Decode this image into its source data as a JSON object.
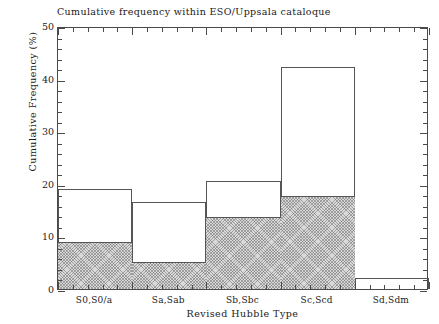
{
  "chart_data": {
    "type": "bar",
    "title": "Cumulative frequency within ESO/Uppsala cataloque",
    "xlabel": "Revised Hubble Type",
    "ylabel": "Cumulative Frequency (%)",
    "categories": [
      "S0,S0/a",
      "Sa,Sab",
      "Sb,Sbc",
      "Sc,Scd",
      "Sd,Sdm"
    ],
    "series": [
      {
        "name": "outlined",
        "style": "open-outline",
        "values": [
          19.0,
          16.5,
          20.5,
          42.2,
          2.0
        ]
      },
      {
        "name": "shaded",
        "style": "hatched-grey",
        "values": [
          8.9,
          5.1,
          13.7,
          17.7,
          0.0
        ]
      }
    ],
    "ylim": [
      0,
      50
    ],
    "yticks": [
      0,
      10,
      20,
      30,
      40,
      50
    ],
    "ytick_labels": [
      "0",
      "10",
      "20",
      "30",
      "40",
      "50"
    ],
    "y_minor_interval": 2,
    "x_minor_per_bin": 5,
    "grid": false,
    "legend": "none",
    "colors": {
      "axis": "#4a4a4a",
      "bar_outline": "#555555",
      "bar_shaded_fill": "#d9d9d9",
      "hatch": "#6e6e6e",
      "background": "#ffffff",
      "text": "#1a1a1a"
    }
  }
}
